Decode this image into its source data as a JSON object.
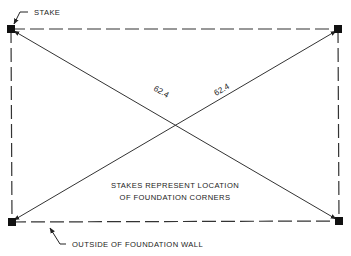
{
  "diagram": {
    "labels": {
      "stake": "STAKE",
      "outside_wall": "OUTSIDE OF FOUNDATION WALL",
      "note_line1": "STAKES REPRESENT LOCATION",
      "note_line2": "OF FOUNDATION CORNERS"
    },
    "diagonals": {
      "left": "62.4",
      "right": "62.4"
    },
    "colors": {
      "line": "#222222",
      "background": "#ffffff"
    }
  }
}
